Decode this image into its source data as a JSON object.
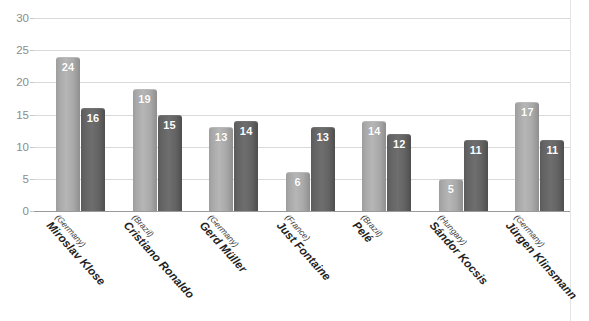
{
  "chart_data": {
    "type": "bar",
    "title": "",
    "subtitle": "",
    "xlabel": "",
    "ylabel": "",
    "ylim": [
      0,
      30
    ],
    "yticks": [
      0,
      5,
      10,
      15,
      20,
      25,
      30
    ],
    "ytick_labels": [
      "0",
      "5",
      "10",
      "15",
      "20",
      "25",
      "30"
    ],
    "grid": true,
    "legend": "none",
    "categories": [
      "Miroslav Klose",
      "Cristiano Ronaldo",
      "Gerd Müller",
      "Just Fontaine",
      "Pelé",
      "Sándor Kocsis",
      "Jürgen Klinsmann"
    ],
    "category_sublabels": [
      "(Germany)",
      "(Brazil)",
      "(Germany)",
      "(France)",
      "(Brazil)",
      "(Hungary)",
      "(Germany)"
    ],
    "series": [
      {
        "name": "series-1",
        "color": "#b0b0b0",
        "values": [
          24,
          19,
          13,
          6,
          14,
          5,
          17
        ]
      },
      {
        "name": "series-2",
        "color": "#636363",
        "values": [
          16,
          15,
          14,
          13,
          12,
          11,
          11
        ]
      }
    ],
    "data_labels": [
      [
        "24",
        "16"
      ],
      [
        "19",
        "15"
      ],
      [
        "13",
        "14"
      ],
      [
        "6",
        "13"
      ],
      [
        "14",
        "12"
      ],
      [
        "5",
        "11"
      ],
      [
        "17",
        "11"
      ]
    ],
    "colors": {
      "series_1": "#b0b0b0",
      "series_2": "#636363",
      "gridline": "#d9d9d9",
      "axis": "#9a9a9a",
      "tick_text": "#8c8c8c",
      "label_text": "#ffffff",
      "category_text": "#1f1f1f",
      "background": "#ffffff"
    }
  }
}
